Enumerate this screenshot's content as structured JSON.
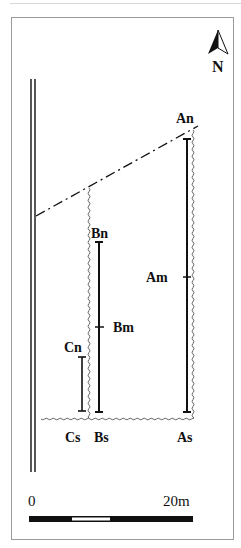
{
  "figure": {
    "north_label": "N",
    "scale": {
      "start_label": "0",
      "end_label": "20m"
    },
    "points": {
      "An": "An",
      "Am": "Am",
      "As": "As",
      "Bn": "Bn",
      "Bm": "Bm",
      "Bs": "Bs",
      "Cn": "Cn",
      "Cs": "Cs"
    }
  }
}
